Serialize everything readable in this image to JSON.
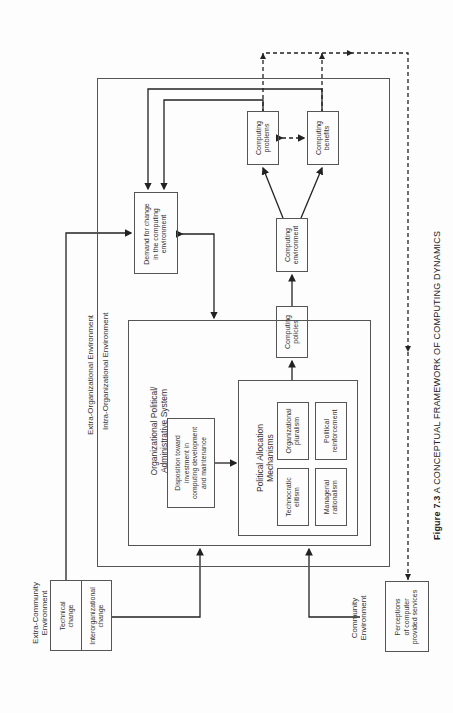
{
  "figure": {
    "number": "Figure 7.3",
    "title": "A CONCEPTUAL FRAMEWORK OF COMPUTING DYNAMICS"
  },
  "regions": {
    "extra_community": "Extra-Community\nEnvironment",
    "community": "Community\nEnvironment",
    "extra_organizational": "Extra-Organizational Environment",
    "intra_organizational": "Intra-Organizational Environment",
    "org_political_system": "Organizational Political/\nAdministrative System",
    "political_allocation": "Political Allocation\nMechanisms"
  },
  "nodes": {
    "technical_change": "Technical\nchange",
    "interorganizational_change": "Interorganizational\nchange",
    "demand_for_change": "Demand for change\nin the computing\nenvironment",
    "disposition": "Disposition toward\ninvestment in\ncomputing development\nand maintenance",
    "organizational_pluralism": "Organizational\npluralism",
    "political_reinforcement": "Political\nreinforcement",
    "technocratic_elitism": "Technocratic\nelitism",
    "managerial_rationalism": "Managerial\nrationalism",
    "computing_policies": "Computing\npolicies",
    "computing_environment": "Computing\nenvironment",
    "computing_problems": "Computing\nproblems",
    "computing_benefits": "Computing\nbenefits",
    "perceptions": "Perceptions\nof computer\nprovided services"
  }
}
